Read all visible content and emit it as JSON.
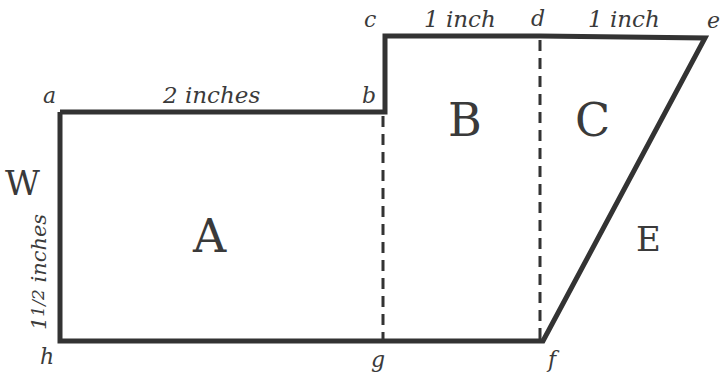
{
  "diagram": {
    "type": "composite-shape-area",
    "colors": {
      "line": "#333333",
      "text": "#3a3a3a",
      "background": "#ffffff"
    },
    "vertices": {
      "a": "a",
      "b": "b",
      "c": "c",
      "d": "d",
      "e": "e",
      "f": "f",
      "g": "g",
      "h": "h"
    },
    "regions": {
      "A": "A",
      "B": "B",
      "C": "C"
    },
    "outside_labels": {
      "W": "W",
      "E": "E"
    },
    "dimensions": {
      "ab": "2 inches",
      "cd": "1 inch",
      "de": "1 inch",
      "ah_whole": "1",
      "ah_frac": "1/2",
      "ah_unit": " inches"
    }
  }
}
